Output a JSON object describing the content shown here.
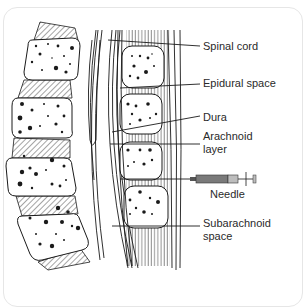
{
  "diagram": {
    "labels": {
      "spinal_cord": "Spinal cord",
      "epidural_space": "Epidural space",
      "dura": "Dura",
      "arachnoid_line1": "Arachnoid",
      "arachnoid_line2": "layer",
      "needle": "Needle",
      "subarachnoid_line1": "Subarachnoid",
      "subarachnoid_line2": "space"
    },
    "colors": {
      "line": "#1a1a1a",
      "needle_body": "#7a7a7a",
      "needle_plunger": "#bdbdbd",
      "frame": "#e6e6e6"
    }
  }
}
